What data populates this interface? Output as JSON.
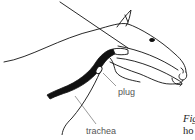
{
  "figure": {
    "labels": {
      "plug": "plug",
      "trachea": "trachea"
    },
    "caption": {
      "line1": "Fig",
      "line2": "ho"
    },
    "colors": {
      "line": "#111111",
      "label_text": "#555555",
      "background": "#ffffff"
    }
  }
}
